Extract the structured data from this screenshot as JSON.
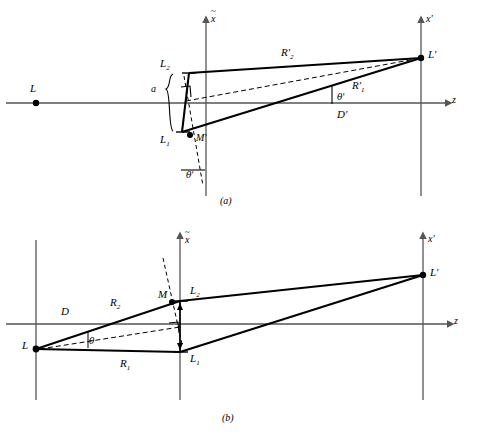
{
  "figure": {
    "background": "#ffffff",
    "stroke_color": "#000000",
    "axis_color": "#555555",
    "panels": [
      {
        "id": "a",
        "caption": "(a)",
        "axes": {
          "horizontal_label": "z",
          "vertical_left_label": "x̃",
          "vertical_right_label": "x'"
        },
        "points": [
          {
            "name": "L",
            "label": "L"
          },
          {
            "name": "L2",
            "label": "L",
            "sub": "2"
          },
          {
            "name": "L1",
            "label": "L",
            "sub": "1"
          },
          {
            "name": "Mprime",
            "label": "M'"
          },
          {
            "name": "Lprime",
            "label": "L'"
          }
        ],
        "segments": [
          {
            "name": "R2prime",
            "label": "R'",
            "sub": "2"
          },
          {
            "name": "R1prime",
            "label": "R'",
            "sub": "1"
          },
          {
            "name": "Dprime",
            "label": "D'"
          }
        ],
        "angles": [
          {
            "name": "theta-prime-at-Lprime",
            "label": "θ'"
          },
          {
            "name": "theta-prime-at-bottom",
            "label": "θ'"
          }
        ],
        "brace_label": "a"
      },
      {
        "id": "b",
        "caption": "(b)",
        "axes": {
          "horizontal_label": "z",
          "vertical_left_label": "x̃",
          "vertical_right_label": "x'"
        },
        "points": [
          {
            "name": "L",
            "label": "L"
          },
          {
            "name": "M",
            "label": "M"
          },
          {
            "name": "L2",
            "label": "L",
            "sub": "2"
          },
          {
            "name": "L1",
            "label": "L",
            "sub": "1"
          },
          {
            "name": "Lprime",
            "label": "L'"
          }
        ],
        "segments": [
          {
            "name": "R2",
            "label": "R",
            "sub": "2"
          },
          {
            "name": "R1",
            "label": "R",
            "sub": "1"
          },
          {
            "name": "D",
            "label": "D"
          }
        ],
        "angles": [
          {
            "name": "theta-at-L",
            "label": "θ"
          }
        ]
      }
    ]
  }
}
